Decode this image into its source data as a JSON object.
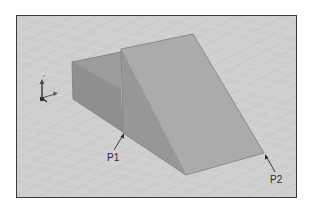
{
  "figure": {
    "labels": {
      "p1": "P1",
      "p2": "P2"
    },
    "colors": {
      "background": "#cfcfcf",
      "frame_border": "#3a3a3a",
      "box_top": "#9a9a9a",
      "box_side": "#8f8f8f",
      "wedge_slope": "#a9a9a9",
      "wedge_side": "#979797",
      "edge": "#6e6e6e",
      "axis_icon": "#4a4a4a"
    },
    "axis_triad": {
      "visible": true
    }
  }
}
